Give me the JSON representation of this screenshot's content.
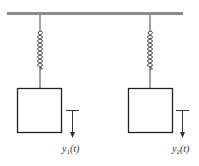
{
  "diagram": {
    "type": "two-mass-spring-system",
    "colors": {
      "ceiling": "#8c8c8c",
      "line": "#333333",
      "spring": "#555555",
      "background": "#ffffff"
    },
    "ceiling": {
      "label": ""
    },
    "masses": [
      {
        "id": "mass-1",
        "label": ""
      },
      {
        "id": "mass-2",
        "label": ""
      }
    ],
    "labels": {
      "y1_var": "y",
      "y1_sub": "1",
      "y1_arg": "(t)",
      "y2_var": "y",
      "y2_sub": "2",
      "y2_arg": "(t)"
    }
  }
}
